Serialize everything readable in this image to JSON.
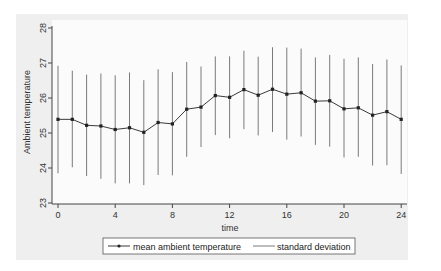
{
  "chart_data": {
    "type": "line",
    "title": "",
    "xlabel": "time",
    "ylabel": "Ambient temperature",
    "xlim": [
      0,
      24
    ],
    "ylim": [
      23,
      28
    ],
    "x_ticks": [
      0,
      4,
      8,
      12,
      16,
      20,
      24
    ],
    "y_ticks": [
      23,
      24,
      25,
      26,
      27,
      28
    ],
    "grid": false,
    "legend_position": "bottom",
    "x": [
      0,
      1,
      2,
      3,
      4,
      5,
      6,
      7,
      8,
      9,
      10,
      11,
      12,
      13,
      14,
      15,
      16,
      17,
      18,
      19,
      20,
      21,
      22,
      23,
      24
    ],
    "series": [
      {
        "name": "mean ambient temperature",
        "style": "line-with-markers",
        "values": [
          25.39,
          25.39,
          25.22,
          25.2,
          25.1,
          25.15,
          25.02,
          25.3,
          25.26,
          25.68,
          25.74,
          26.07,
          26.02,
          26.24,
          26.08,
          26.25,
          26.11,
          26.15,
          25.91,
          25.92,
          25.69,
          25.72,
          25.51,
          25.61,
          25.39
        ]
      },
      {
        "name": "standard deviation",
        "style": "vertical-range",
        "upper": [
          26.92,
          26.78,
          26.67,
          26.7,
          26.65,
          26.73,
          26.51,
          26.82,
          26.74,
          27.03,
          26.9,
          27.19,
          27.19,
          27.35,
          27.18,
          27.45,
          27.44,
          27.41,
          27.16,
          27.23,
          27.12,
          27.16,
          26.97,
          27.1,
          26.93
        ],
        "lower": [
          23.85,
          24.02,
          23.77,
          23.69,
          23.56,
          23.56,
          23.51,
          23.8,
          23.79,
          24.32,
          24.6,
          24.94,
          24.85,
          25.11,
          24.93,
          25.03,
          24.81,
          24.9,
          24.66,
          24.61,
          24.3,
          24.32,
          24.07,
          24.08,
          23.83
        ]
      }
    ]
  },
  "legend": {
    "items": [
      {
        "label": "mean ambient temperature"
      },
      {
        "label": "standard deviation"
      }
    ]
  },
  "colors": {
    "panel_bg": "#efefef",
    "plot_bg": "#fbfbfb",
    "mean_line": "#3a3a3a",
    "sd_line": "#7a7a7a",
    "axis": "#444444"
  }
}
